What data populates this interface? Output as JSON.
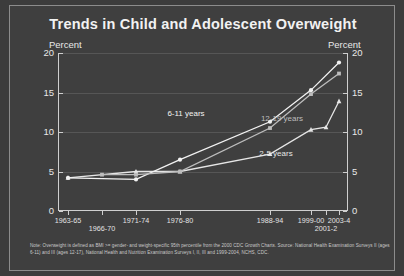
{
  "chart_data": {
    "type": "line",
    "title": "Trends in Child and Adolescent Overweight",
    "xlabel": "",
    "ylabel": "Percent",
    "ylabel_right": "Percent",
    "ylim": [
      0,
      20
    ],
    "yticks": [
      0,
      5,
      10,
      15,
      20
    ],
    "grid": true,
    "legend": "inline-annotations",
    "categories": [
      "1963-65",
      "1966-70",
      "1971-74",
      "1976-80",
      "1988-94",
      "1999-00",
      "2001-2",
      "2003-4"
    ],
    "series": [
      {
        "name": "2-5 years",
        "marker": "triangle",
        "color": "#e6e6e6",
        "x": [
          "1963-65",
          "1971-74",
          "1976-80",
          "1988-94",
          "1999-00",
          "2001-2",
          "2003-4"
        ],
        "values": [
          4.2,
          5.0,
          5.0,
          7.2,
          10.3,
          10.6,
          13.9
        ]
      },
      {
        "name": "6-11 years",
        "marker": "circle",
        "color": "#f2f2f2",
        "x": [
          "1963-65",
          "1971-74",
          "1976-80",
          "1988-94",
          "1999-00",
          "2003-4"
        ],
        "values": [
          4.2,
          4.0,
          6.5,
          11.3,
          15.3,
          18.8
        ]
      },
      {
        "name": "12-19 years",
        "marker": "square",
        "color": "#bdbdbd",
        "x": [
          "1966-70",
          "1971-74",
          "1976-80",
          "1988-94",
          "1999-00",
          "2003-4"
        ],
        "values": [
          4.6,
          4.6,
          5.0,
          10.5,
          14.8,
          17.4
        ]
      }
    ],
    "annotations": [
      {
        "text": "6-11 years",
        "value_x": "1983",
        "value_y": 12.4
      },
      {
        "text": "12-19 years",
        "value_x": "1995",
        "value_y": 11.8
      },
      {
        "text": "2-5 years",
        "value_x": "1996",
        "value_y": 7.4
      }
    ],
    "footnote": "Note: Overweight is defined as BMI >= gender- and weight-specific 95th percentile from the 2000 CDC Growth Charts. Source: National Health Examination Surveys II (ages 6-11) and III (ages 12-17), National Health and Nutrition Examination Surveys I, II, III and 1999-2004, NCHS, CDC."
  },
  "axis": {
    "unit_left": "Percent",
    "unit_right": "Percent",
    "ytick_labels": [
      "20",
      "15",
      "10",
      "5",
      "0"
    ],
    "xtick_labels": [
      "1963-65",
      "1966-70",
      "1971-74",
      "1976-80",
      "1988-94",
      "1999-00",
      "2001-2",
      "2003-4"
    ]
  }
}
